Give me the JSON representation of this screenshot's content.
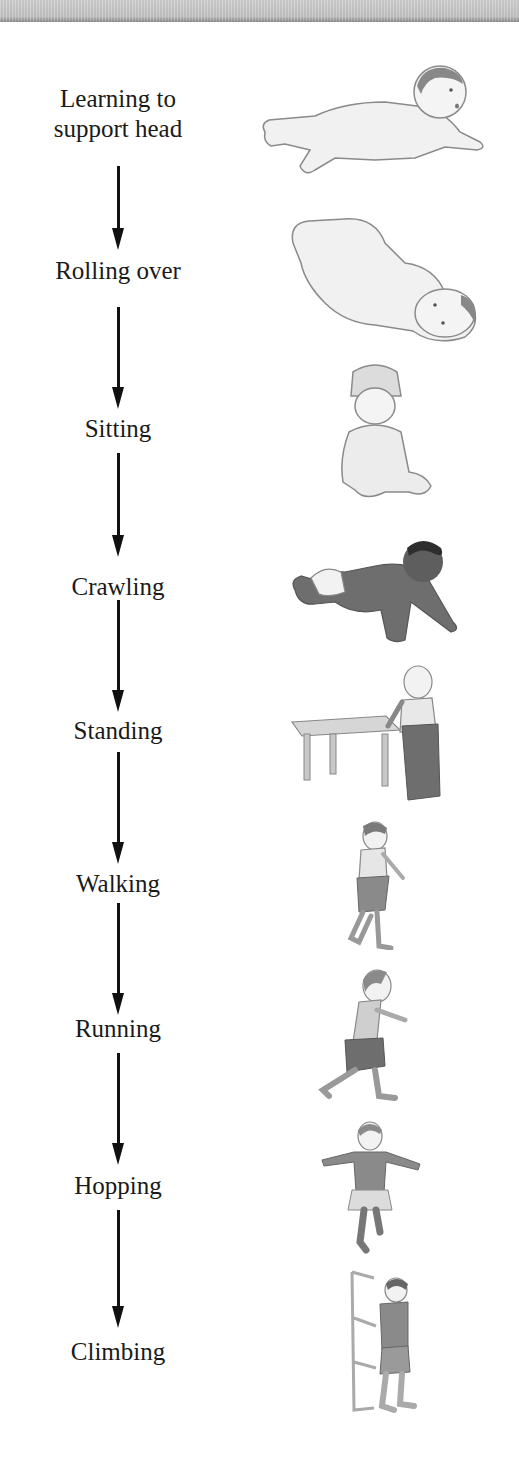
{
  "stages": [
    {
      "label_line1": "Learning to",
      "label_line2": "support head",
      "figure": "baby-lying-prone-lifting-head"
    },
    {
      "label_line1": "Rolling over",
      "figure": "baby-rolling-on-back"
    },
    {
      "label_line1": "Sitting",
      "figure": "baby-sitting-with-hat"
    },
    {
      "label_line1": "Crawling",
      "figure": "baby-crawling"
    },
    {
      "label_line1": "Standing",
      "figure": "toddler-standing-holding-table"
    },
    {
      "label_line1": "Walking",
      "figure": "toddler-walking"
    },
    {
      "label_line1": "Running",
      "figure": "child-running"
    },
    {
      "label_line1": "Hopping",
      "figure": "child-hopping-arms-out"
    },
    {
      "label_line1": "Climbing",
      "figure": "child-climbing-ladder"
    }
  ],
  "colors": {
    "text": "#1a1a1a",
    "arrow": "#111111",
    "figure_line": "#8a8a8a",
    "figure_fill": "#e6e6e6",
    "figure_dark": "#6e6e6e",
    "topbar": "#c4c4c4"
  }
}
